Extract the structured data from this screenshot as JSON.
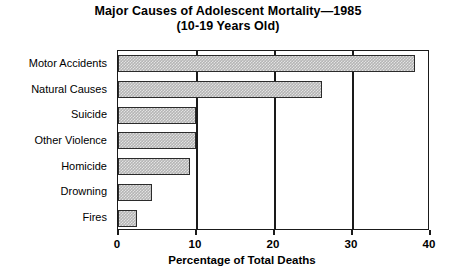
{
  "chart_data": {
    "type": "bar",
    "orientation": "horizontal",
    "title": "Major Causes of Adolescent Mortality—1985",
    "subtitle": "(10-19 Years Old)",
    "xlabel": "Percentage of Total Deaths",
    "ylabel": "",
    "xlim": [
      0,
      40
    ],
    "xticks": [
      0,
      10,
      20,
      30,
      40
    ],
    "xtick_labels": [
      "0",
      "10",
      "20",
      "30",
      "40"
    ],
    "grid": true,
    "legend": false,
    "categories": [
      "Motor Accidents",
      "Natural Causes",
      "Suicide",
      "Other Violence",
      "Homicide",
      "Drowning",
      "Fires"
    ],
    "values": [
      38.1,
      26.2,
      10.0,
      10.0,
      9.2,
      4.4,
      2.4
    ],
    "bar_fill_color": "#b5b5b5",
    "bar_edge_color": "#2b2b2b",
    "axis_color": "#1a1a1a"
  }
}
